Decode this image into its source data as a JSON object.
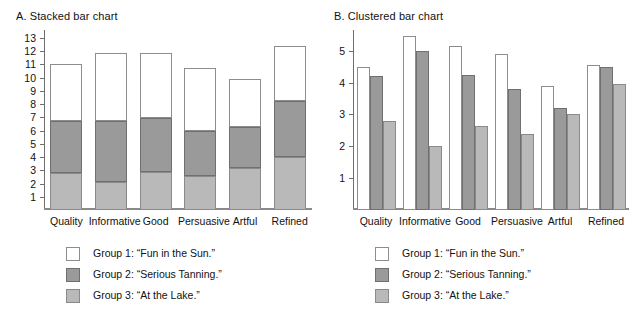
{
  "figure": {
    "width": 637,
    "height": 334,
    "background": "#ffffff"
  },
  "colors": {
    "group1_fill": "#ffffff",
    "group1_stroke": "#8d8d8d",
    "group2_fill": "#9a9a9a",
    "group2_stroke": "#6f6f6f",
    "group3_fill": "#b9b9b9",
    "group3_stroke": "#8a8a8a",
    "axis": "#6e6e6e",
    "text": "#111111"
  },
  "legend": {
    "items": [
      {
        "label": "Group 1: “Fun in the Sun.”",
        "swatch": "group1"
      },
      {
        "label": "Group 2: “Serious Tanning.”",
        "swatch": "group2"
      },
      {
        "label": "Group 3: “At the Lake.”",
        "swatch": "group3"
      }
    ]
  },
  "panels": [
    {
      "id": "a",
      "title": "A. Stacked bar chart"
    },
    {
      "id": "b",
      "title": "B. Clustered bar chart"
    }
  ],
  "chart_data": [
    {
      "type": "bar",
      "subtype": "stacked",
      "panel": "A",
      "title": "A. Stacked bar chart",
      "xlabel": "",
      "ylabel": "",
      "ylim": [
        0,
        13.6
      ],
      "yticks": [
        1,
        2,
        3,
        4,
        5,
        6,
        7,
        8,
        9,
        10,
        11,
        12,
        13
      ],
      "grid": false,
      "legend_position": "below",
      "categories": [
        "Quality",
        "Informative",
        "Good",
        "Persuasive",
        "Artful",
        "Refined"
      ],
      "stack_order_bottom_to_top": [
        "Group 3",
        "Group 2",
        "Group 1"
      ],
      "series": [
        {
          "name": "Group 1: “Fun in the Sun.”",
          "values": [
            4.3,
            5.15,
            4.9,
            4.7,
            3.6,
            4.2
          ]
        },
        {
          "name": "Group 2: “Serious Tanning.”",
          "values": [
            3.95,
            4.6,
            4.1,
            3.45,
            3.15,
            4.2
          ]
        },
        {
          "name": "Group 3: “At the Lake.”",
          "values": [
            2.8,
            2.15,
            2.85,
            2.55,
            3.15,
            4.0
          ]
        }
      ],
      "cumulative_tops": {
        "group3": [
          2.8,
          2.15,
          2.85,
          2.55,
          3.15,
          4.0
        ],
        "group2": [
          6.75,
          6.75,
          6.95,
          6.0,
          6.3,
          8.2
        ],
        "group1": [
          11.05,
          11.9,
          11.85,
          10.7,
          9.9,
          12.4
        ]
      }
    },
    {
      "type": "bar",
      "subtype": "clustered",
      "panel": "B",
      "title": "B. Clustered bar chart",
      "xlabel": "",
      "ylabel": "",
      "ylim": [
        0,
        5.65
      ],
      "yticks": [
        1,
        2,
        3,
        4,
        5
      ],
      "grid": false,
      "legend_position": "below",
      "categories": [
        "Quality",
        "Informative",
        "Good",
        "Persuasive",
        "Artful",
        "Refined"
      ],
      "series": [
        {
          "name": "Group 1: “Fun in the Sun.”",
          "values": [
            4.5,
            5.45,
            5.15,
            4.9,
            3.9,
            4.55
          ]
        },
        {
          "name": "Group 2: “Serious Tanning.”",
          "values": [
            4.2,
            5.0,
            4.25,
            3.8,
            3.2,
            4.5
          ]
        },
        {
          "name": "Group 3: “At the Lake.”",
          "values": [
            2.8,
            2.0,
            2.65,
            2.4,
            3.0,
            3.95
          ]
        }
      ]
    }
  ]
}
